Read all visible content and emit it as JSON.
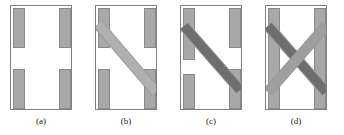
{
  "figure": {
    "type": "technical-diagram",
    "background_color": "#ffffff",
    "frame_border_color": "#808080",
    "bar_fill_color": "#a8a8a8",
    "bar_border_color": "#8a8a8a",
    "band_light_color": "#b4b4b4",
    "band_dark_color": "#6e6e6e",
    "band_edge_color": "#9a9a9a"
  },
  "panels": [
    {
      "id": "a",
      "caption": "(a)",
      "x": 10,
      "y": 5,
      "width": 62,
      "height": 105,
      "caption_center_x": 41,
      "bars": [
        {
          "name": "top-left-bar",
          "x": 2,
          "y": 2,
          "w": 12,
          "h": 40
        },
        {
          "name": "top-right-bar",
          "x": 48,
          "y": 2,
          "w": 12,
          "h": 40
        },
        {
          "name": "bottom-left-bar",
          "x": 2,
          "y": 63,
          "w": 12,
          "h": 40
        },
        {
          "name": "bottom-right-bar",
          "x": 48,
          "y": 63,
          "w": 12,
          "h": 40
        }
      ],
      "bands": []
    },
    {
      "id": "b",
      "caption": "(b)",
      "x": 95,
      "y": 5,
      "width": 62,
      "height": 105,
      "caption_center_x": 126,
      "bars": [
        {
          "name": "top-left-bar",
          "x": 2,
          "y": 2,
          "w": 12,
          "h": 40
        },
        {
          "name": "top-right-bar",
          "x": 48,
          "y": 2,
          "w": 12,
          "h": 40
        },
        {
          "name": "bottom-left-bar",
          "x": 2,
          "y": 63,
          "w": 12,
          "h": 40
        },
        {
          "name": "bottom-right-bar",
          "x": 48,
          "y": 63,
          "w": 12,
          "h": 40
        }
      ],
      "bands": [
        {
          "name": "diagonal-band-descending",
          "x1": 2,
          "y1": 18,
          "x2": 60,
          "y2": 86,
          "thickness": 9,
          "color": "#b0b0b0"
        }
      ]
    },
    {
      "id": "c",
      "caption": "(c)",
      "x": 180,
      "y": 5,
      "width": 62,
      "height": 105,
      "caption_center_x": 211,
      "bars": [
        {
          "name": "top-left-bar",
          "x": 2,
          "y": 2,
          "w": 12,
          "h": 52
        },
        {
          "name": "top-right-bar",
          "x": 48,
          "y": 2,
          "w": 12,
          "h": 40
        },
        {
          "name": "bottom-left-bar",
          "x": 2,
          "y": 68,
          "w": 12,
          "h": 35
        },
        {
          "name": "bottom-right-bar",
          "x": 48,
          "y": 63,
          "w": 12,
          "h": 40
        }
      ],
      "bands": [
        {
          "name": "diagonal-band-descending",
          "x1": 3,
          "y1": 20,
          "x2": 59,
          "y2": 84,
          "thickness": 9,
          "color": "#6e6e6e"
        }
      ]
    },
    {
      "id": "d",
      "caption": "(d)",
      "x": 265,
      "y": 5,
      "width": 62,
      "height": 105,
      "caption_center_x": 296,
      "bars": [
        {
          "name": "left-bar-full",
          "x": 2,
          "y": 2,
          "w": 12,
          "h": 101
        },
        {
          "name": "right-bar-full",
          "x": 48,
          "y": 2,
          "w": 12,
          "h": 101
        }
      ],
      "bands": [
        {
          "name": "diagonal-band-descending",
          "x1": 2,
          "y1": 20,
          "x2": 60,
          "y2": 86,
          "thickness": 9,
          "color": "#6e6e6e"
        },
        {
          "name": "diagonal-band-ascending",
          "x1": 2,
          "y1": 86,
          "x2": 60,
          "y2": 20,
          "thickness": 9,
          "color": "#9e9e9e"
        }
      ]
    }
  ]
}
